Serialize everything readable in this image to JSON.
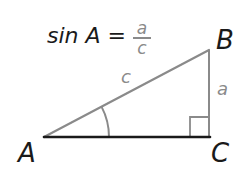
{
  "formula": {
    "lhs": "sin A =",
    "numerator": "a",
    "denominator": "c"
  },
  "vertices": {
    "A": "A",
    "B": "B",
    "C": "C"
  },
  "sides": {
    "hypotenuse": "c",
    "opposite": "a"
  },
  "colors": {
    "ink": "#1a1a1a",
    "gray": "#8a8a8a"
  },
  "geometry": {
    "A": [
      44,
      137
    ],
    "B": [
      209,
      50
    ],
    "C": [
      209,
      137
    ],
    "right_angle_at": "C",
    "angle_marked_at": "A"
  }
}
